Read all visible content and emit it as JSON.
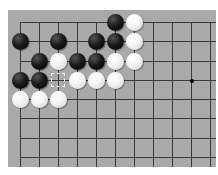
{
  "board": {
    "background": "#a9a9a9",
    "line_color": "#3a3a3a",
    "grid_x": [
      12,
      31,
      50,
      69,
      88,
      107,
      126,
      145,
      164,
      183,
      202
    ],
    "grid_y": [
      12,
      31,
      51,
      70,
      89,
      108,
      128,
      147
    ],
    "star_points": [
      {
        "col": 9,
        "row": 3
      }
    ],
    "last_move_marker": {
      "col": 2,
      "row": 3
    },
    "stones": [
      {
        "color": "black",
        "col": 5,
        "row": 0
      },
      {
        "color": "white",
        "col": 6,
        "row": 0
      },
      {
        "color": "black",
        "col": 0,
        "row": 1
      },
      {
        "color": "black",
        "col": 2,
        "row": 1
      },
      {
        "color": "black",
        "col": 4,
        "row": 1
      },
      {
        "color": "black",
        "col": 5,
        "row": 1
      },
      {
        "color": "white",
        "col": 6,
        "row": 1
      },
      {
        "color": "black",
        "col": 1,
        "row": 2
      },
      {
        "color": "white",
        "col": 2,
        "row": 2
      },
      {
        "color": "black",
        "col": 3,
        "row": 2
      },
      {
        "color": "black",
        "col": 4,
        "row": 2
      },
      {
        "color": "white",
        "col": 5,
        "row": 2
      },
      {
        "color": "white",
        "col": 6,
        "row": 2
      },
      {
        "color": "black",
        "col": 0,
        "row": 3
      },
      {
        "color": "black",
        "col": 1,
        "row": 3
      },
      {
        "color": "white",
        "col": 3,
        "row": 3
      },
      {
        "color": "white",
        "col": 4,
        "row": 3
      },
      {
        "color": "white",
        "col": 5,
        "row": 3
      },
      {
        "color": "white",
        "col": 0,
        "row": 4
      },
      {
        "color": "white",
        "col": 1,
        "row": 4
      },
      {
        "color": "white",
        "col": 2,
        "row": 4
      }
    ]
  }
}
